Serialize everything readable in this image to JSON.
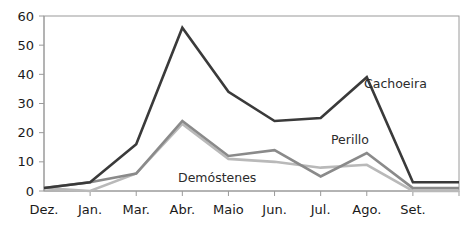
{
  "chart_data": {
    "type": "line",
    "title": "",
    "subtitle": "",
    "xlabel": "",
    "ylabel": "",
    "xlim": [
      0,
      10
    ],
    "ylim": [
      0,
      60
    ],
    "grid": false,
    "legend_position": "inline-annotations",
    "categories": [
      "Dez.",
      "Jan.",
      "Mar.",
      "Abr.",
      "Maio",
      "Jun.",
      "Jul.",
      "Ago.",
      "Set.",
      ""
    ],
    "ytick_labels": [
      "0",
      "10",
      "20",
      "30",
      "40",
      "50",
      "60"
    ],
    "ytick_values": [
      0,
      10,
      20,
      30,
      40,
      50,
      60
    ],
    "series": [
      {
        "name": "Cachoeira",
        "color": "#3a3a3a",
        "width": 2.6,
        "values": [
          1,
          3,
          16,
          56,
          34,
          24,
          25,
          39,
          3,
          3
        ]
      },
      {
        "name": "Perillo",
        "color": "#8a8a8a",
        "width": 2.6,
        "values": [
          1,
          3,
          6,
          24,
          12,
          14,
          5,
          13,
          1,
          1
        ]
      },
      {
        "name": "Demóstenes",
        "color": "#b9b9b9",
        "width": 2.6,
        "values": [
          1,
          0,
          6,
          23,
          11,
          10,
          8,
          9,
          0,
          0
        ]
      }
    ],
    "annotations": [
      {
        "text": "Cachoeira",
        "series": "Cachoeira",
        "x_px": 364,
        "y_px": 84
      },
      {
        "text": "Perillo",
        "series": "Perillo",
        "x_px": 331,
        "y_px": 140
      },
      {
        "text": "Demóstenes",
        "series": "Demóstenes",
        "x_px": 178,
        "y_px": 178
      }
    ]
  }
}
